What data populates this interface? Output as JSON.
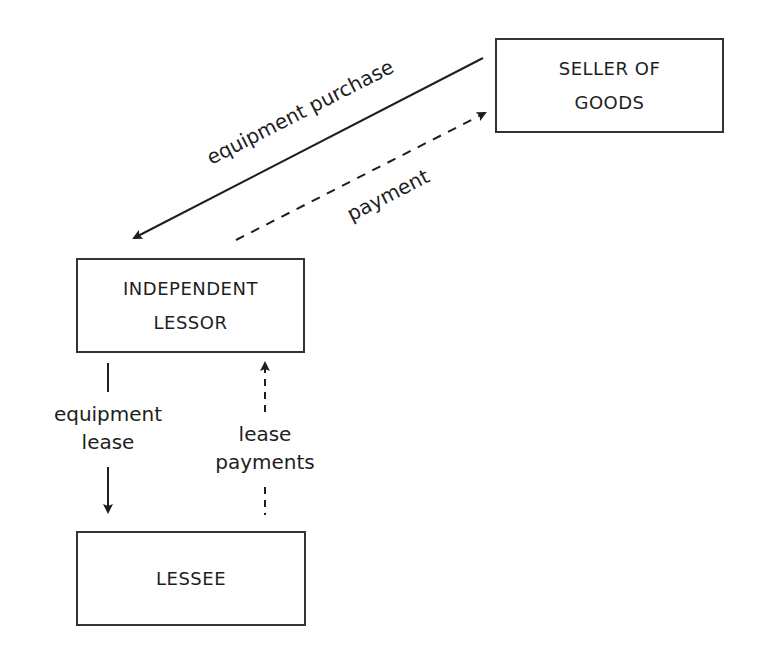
{
  "nodes": {
    "seller": {
      "line1": "SELLER OF",
      "line2": "GOODS"
    },
    "lessor": {
      "line1": "INDEPENDENT",
      "line2": "LESSOR"
    },
    "lessee": {
      "line1": "LESSEE"
    }
  },
  "edges": {
    "equipment_purchase": {
      "label": "equipment purchase",
      "from": "seller",
      "to": "lessor",
      "style": "solid"
    },
    "payment": {
      "label": "payment",
      "from": "lessor",
      "to": "seller",
      "style": "dashed"
    },
    "equipment_lease": {
      "line1": "equipment",
      "line2": "lease",
      "from": "lessor",
      "to": "lessee",
      "style": "solid"
    },
    "lease_payments": {
      "line1": "lease",
      "line2": "payments",
      "from": "lessee",
      "to": "lessor",
      "style": "dashed"
    }
  },
  "colors": {
    "stroke": "#1e1e1e",
    "border": "#333333",
    "background": "#ffffff"
  }
}
